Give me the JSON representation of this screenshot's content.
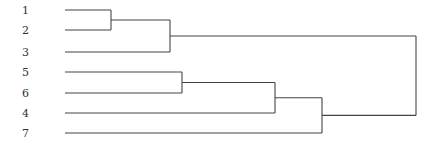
{
  "chart_data": {
    "type": "dendrogram",
    "title": "",
    "orientation": "left-to-right",
    "leaves": [
      {
        "label": "1",
        "y": 10
      },
      {
        "label": "2",
        "y": 30
      },
      {
        "label": "3",
        "y": 52
      },
      {
        "label": "5",
        "y": 72
      },
      {
        "label": "6",
        "y": 93
      },
      {
        "label": "4",
        "y": 113
      },
      {
        "label": "7",
        "y": 133
      }
    ],
    "merges": [
      {
        "children": [
          "1",
          "2"
        ],
        "height_x": 111
      },
      {
        "children": [
          "(1,2)",
          "3"
        ],
        "height_x": 170
      },
      {
        "children": [
          "5",
          "6"
        ],
        "height_x": 182
      },
      {
        "children": [
          "(5,6)",
          "4"
        ],
        "height_x": 275
      },
      {
        "children": [
          "((5,6),4)",
          "7"
        ],
        "height_x": 322
      },
      {
        "children": [
          "((1,2),3)",
          "(((5,6),4),7)"
        ],
        "height_x": 416
      }
    ],
    "axis": "none",
    "grid": false,
    "legend": "none"
  },
  "colors": {
    "line": "#444444",
    "label": "#333333",
    "background": "#ffffff"
  }
}
